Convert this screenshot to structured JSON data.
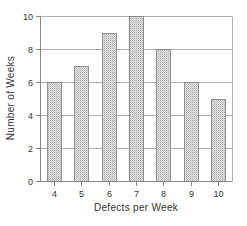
{
  "chart_data": {
    "type": "bar",
    "title": "",
    "xlabel": "Defects per Week",
    "ylabel": "Number of Weeks",
    "categories": [
      "4",
      "5",
      "6",
      "7",
      "8",
      "9",
      "10"
    ],
    "values": [
      6,
      7,
      9,
      10,
      8,
      6,
      5
    ],
    "ylim": [
      0,
      10
    ],
    "yticks": [
      0,
      2,
      4,
      6,
      8,
      10
    ],
    "grid": true,
    "legend": "none"
  },
  "colors": {
    "bar_fill": "#e2e2e2",
    "bar_stipple": "#a8a8a8",
    "bar_edge": "#7a7a7a",
    "grid": "#b0b0b0",
    "axis": "#888888",
    "text": "#333333"
  }
}
